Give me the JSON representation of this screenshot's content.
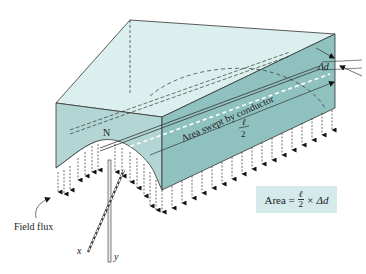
{
  "figure": {
    "pole_label": "N",
    "swept_area_label": "Area swept by conductor",
    "half_length_numerator": "ℓ",
    "half_length_denominator": "2",
    "delta_d_label": "Δd",
    "field_flux_label": "Field flux",
    "axis_x_label": "x",
    "axis_y_label": "y",
    "formula": {
      "lhs": "Area =",
      "frac_num": "ℓ",
      "frac_den": "2",
      "rhs": "× Δd"
    },
    "colors": {
      "top_face": "#dcefef",
      "front_face": "#b3d6d5",
      "side_face": "#8fc1bf",
      "formula_bg": "#d5eaea",
      "line": "#333333"
    }
  }
}
